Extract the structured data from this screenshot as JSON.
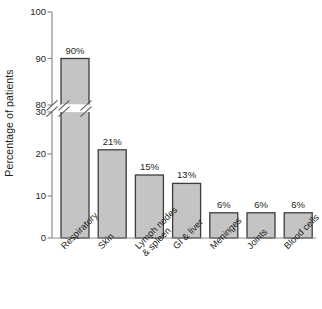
{
  "chart_data": {
    "type": "bar",
    "title": "",
    "subtitle": "",
    "xlabel": "",
    "ylabel": "Percentage of patients",
    "categories": [
      "Respiratory",
      "Lymph nodes\n& spleen",
      "GI & liver",
      "Meninges",
      "Joints",
      "Blood cells",
      "Skin"
    ],
    "category_labels": [
      "Respiratory",
      "Skin",
      "Lymph nodes\n& spleen",
      "GI & liver",
      "Meninges",
      "Joints",
      "Blood cells"
    ],
    "values": [
      90,
      21,
      15,
      13,
      6,
      6,
      6
    ],
    "data_labels": [
      "90%",
      "21%",
      "15%",
      "13%",
      "6%",
      "6%",
      "6%"
    ],
    "ylim": [
      0,
      100
    ],
    "yticks": [
      0,
      10,
      20,
      30,
      80,
      90,
      100
    ],
    "ytick_labels": [
      "0",
      "10",
      "20",
      "30",
      "80",
      "90",
      "100"
    ],
    "axis_break": {
      "present": true,
      "between": [
        30,
        80
      ],
      "style": "double-slash"
    },
    "grid": false,
    "legend": false,
    "legend_position": "none",
    "colors": {
      "bar_fill": "#c4c4c4",
      "bar_stroke": "#3d3d3d",
      "axis": "#8d8d8d",
      "text": "#231f20",
      "background": "#ffffff"
    }
  },
  "figure": {
    "y_axis_title": "Percentage of patients"
  }
}
